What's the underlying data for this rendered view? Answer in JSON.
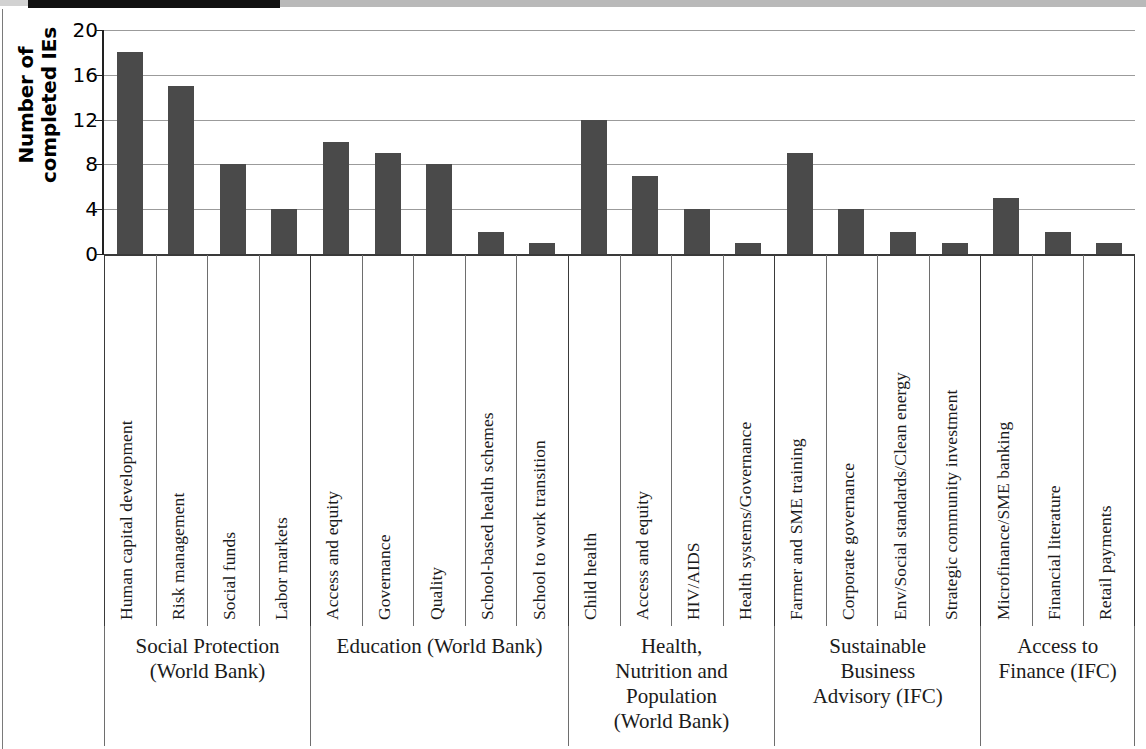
{
  "chart_data": {
    "type": "bar",
    "title": "",
    "xlabel": "",
    "ylabel": "Number of\ncompleted IEs",
    "ylim": [
      0,
      20
    ],
    "yticks": [
      "0",
      "4",
      "8",
      "12",
      "16",
      "20"
    ],
    "ytick_values": [
      0,
      4,
      8,
      12,
      16,
      20
    ],
    "grid": true,
    "legend": null,
    "bar_color": "#4a4a4a",
    "categories": [
      "Human capital development",
      "Risk management",
      "Social funds",
      "Labor markets",
      "Access and equity",
      "Governance",
      "Quality",
      "School-based health schemes",
      "School to work transition",
      "Child health",
      "Access and equity",
      "HIV/AIDS",
      "Health systems/Governance",
      "Farmer and SME training",
      "Corporate governance",
      "Env/Social standards/Clean energy",
      "Strategic community investment",
      "Microfinance/SME banking",
      "Financial literature",
      "Retail payments"
    ],
    "values": [
      18,
      15,
      8,
      4,
      10,
      9,
      8,
      2,
      1,
      12,
      7,
      4,
      1,
      9,
      4,
      2,
      1,
      5,
      2,
      1
    ],
    "groups": [
      {
        "label": "Social Protection\n(World Bank)",
        "count": 4
      },
      {
        "label": "Education (World Bank)",
        "count": 5
      },
      {
        "label": "Health,\nNutrition and\nPopulation\n(World Bank)",
        "count": 4
      },
      {
        "label": "Sustainable\nBusiness\nAdvisory (IFC)",
        "count": 4
      },
      {
        "label": "Access to\nFinance (IFC)",
        "count": 3
      }
    ]
  }
}
